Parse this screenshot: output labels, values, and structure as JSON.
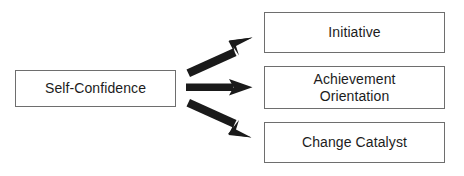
{
  "diagram": {
    "type": "flow-arrow-diagram",
    "background_color": "#ffffff",
    "box_border_color": "#6e6e6e",
    "arrow_color": "#1a1a1a",
    "text_color": "#1c1c1c",
    "source": {
      "label": "Self-Confidence"
    },
    "targets": [
      {
        "label": "Initiative"
      },
      {
        "label": "Achievement\nOrientation"
      },
      {
        "label": "Change Catalyst"
      }
    ],
    "arrows": [
      {
        "name": "arrow-to-initiative",
        "direction": "up-right"
      },
      {
        "name": "arrow-to-achievement-orientation",
        "direction": "right"
      },
      {
        "name": "arrow-to-change-catalyst",
        "direction": "down-right"
      }
    ]
  }
}
